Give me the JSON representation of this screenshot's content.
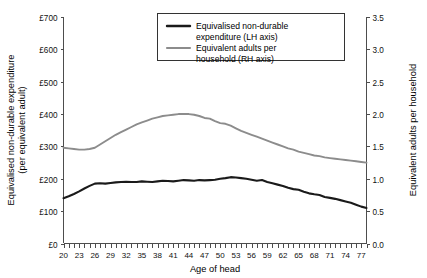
{
  "chart_data": {
    "type": "line",
    "title": "",
    "xlabel": "Age of head",
    "ylabel": "Equivalised non-durable expenditure (per equivalent adult)",
    "ylabel_right": "Equivalent adults per household",
    "grid": false,
    "legend_position": "top-right",
    "xlim": [
      20,
      78
    ],
    "ylim": [
      0,
      700
    ],
    "ylim_right": [
      0,
      3.5
    ],
    "x_tick_step": 3,
    "x_minor_tick_step": 1,
    "xticks": [
      20,
      23,
      26,
      29,
      32,
      35,
      38,
      41,
      44,
      47,
      50,
      53,
      56,
      59,
      62,
      65,
      68,
      71,
      74,
      77
    ],
    "xtick_labels": [
      "20",
      "23",
      "26",
      "29",
      "32",
      "35",
      "38",
      "41",
      "44",
      "47",
      "50",
      "53",
      "56",
      "59",
      "62",
      "65",
      "68",
      "71",
      "74",
      "77"
    ],
    "yticks": [
      0,
      100,
      200,
      300,
      400,
      500,
      600,
      700
    ],
    "ytick_labels": [
      "£0",
      "£100",
      "£200",
      "£300",
      "£400",
      "£500",
      "£600",
      "£700"
    ],
    "yticks_right": [
      0.0,
      0.5,
      1.0,
      1.5,
      2.0,
      2.5,
      3.0,
      3.5
    ],
    "ytick_labels_right": [
      "0.0",
      "0.5",
      "1.0",
      "1.5",
      "2.0",
      "2.5",
      "3.0",
      "3.5"
    ],
    "x": [
      20,
      21,
      22,
      23,
      24,
      25,
      26,
      27,
      28,
      29,
      30,
      31,
      32,
      33,
      34,
      35,
      36,
      37,
      38,
      39,
      40,
      41,
      42,
      43,
      44,
      45,
      46,
      47,
      48,
      49,
      50,
      51,
      52,
      53,
      54,
      55,
      56,
      57,
      58,
      59,
      60,
      61,
      62,
      63,
      64,
      65,
      66,
      67,
      68,
      69,
      70,
      71,
      72,
      73,
      74,
      75,
      76,
      77,
      78
    ],
    "series": [
      {
        "name": "Equivalised non-durable expenditure (LH axis)",
        "axis": "left",
        "color": "#1a1a1a",
        "width": 2.1,
        "values": [
          140,
          146,
          153,
          161,
          170,
          178,
          185,
          186,
          185,
          187,
          189,
          190,
          191,
          190,
          190,
          192,
          191,
          190,
          192,
          194,
          193,
          192,
          194,
          196,
          195,
          194,
          196,
          195,
          196,
          197,
          200,
          202,
          205,
          204,
          202,
          200,
          197,
          194,
          196,
          190,
          186,
          182,
          178,
          172,
          168,
          166,
          160,
          155,
          152,
          150,
          144,
          141,
          138,
          134,
          130,
          126,
          120,
          114,
          110
        ]
      },
      {
        "name": "Equivalent adults per household (RH axis)",
        "axis": "right",
        "color": "#8c8c8c",
        "width": 1.9,
        "values": [
          1.48,
          1.47,
          1.46,
          1.45,
          1.45,
          1.46,
          1.48,
          1.53,
          1.58,
          1.63,
          1.68,
          1.72,
          1.76,
          1.8,
          1.84,
          1.87,
          1.9,
          1.93,
          1.95,
          1.97,
          1.98,
          1.99,
          2.0,
          2.0,
          2.0,
          1.99,
          1.97,
          1.94,
          1.93,
          1.89,
          1.86,
          1.85,
          1.82,
          1.78,
          1.74,
          1.71,
          1.68,
          1.65,
          1.62,
          1.59,
          1.56,
          1.53,
          1.5,
          1.47,
          1.45,
          1.42,
          1.4,
          1.38,
          1.36,
          1.35,
          1.33,
          1.32,
          1.31,
          1.3,
          1.29,
          1.28,
          1.27,
          1.26,
          1.25
        ]
      }
    ]
  },
  "legend": {
    "entries": [
      {
        "line1": "Equivalised non-durable",
        "line2": "expenditure (LH axis)",
        "color": "#1a1a1a"
      },
      {
        "line1": "Equivalent adults per",
        "line2": "household (RH axis)",
        "color": "#8c8c8c"
      }
    ]
  },
  "axis_titles": {
    "left_line1": "Equivalised non-durable expenditure",
    "left_line2": "(per equivalent adult)",
    "right": "Equivalent adults per household",
    "bottom": "Age of head"
  }
}
